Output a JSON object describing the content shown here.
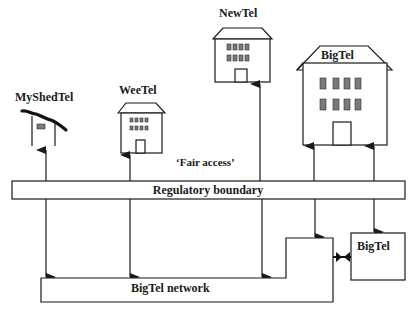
{
  "diagram": {
    "entities": [
      {
        "id": "myshedtel",
        "label": "MyShedTel",
        "type": "shed"
      },
      {
        "id": "weetel",
        "label": "WeeTel",
        "type": "small-building"
      },
      {
        "id": "newtel",
        "label": "NewTel",
        "type": "medium-building"
      },
      {
        "id": "bigtel_building",
        "label": "BigTel",
        "type": "large-building"
      },
      {
        "id": "bigtel_box",
        "label": "BigTel",
        "type": "box"
      }
    ],
    "annotation": "‘Fair access’",
    "regulatory_boundary": {
      "label": "Regulatory boundary"
    },
    "network": {
      "label": "BigTel network"
    },
    "connections": [
      {
        "from": "myshedtel",
        "to": "bigtel_network",
        "via": "regulatory_boundary",
        "direction": "bidirectional"
      },
      {
        "from": "weetel",
        "to": "bigtel_network",
        "via": "regulatory_boundary",
        "direction": "bidirectional"
      },
      {
        "from": "newtel",
        "to": "bigtel_network",
        "via": "regulatory_boundary",
        "direction": "bidirectional"
      },
      {
        "from": "bigtel_building",
        "to": "bigtel_network",
        "via": "regulatory_boundary",
        "direction": "bidirectional"
      },
      {
        "from": "bigtel_building",
        "to": "bigtel_box",
        "via": "regulatory_boundary",
        "direction": "bidirectional"
      },
      {
        "from": "bigtel_box",
        "to": "bigtel_network",
        "direction": "bidirectional-connector"
      }
    ]
  }
}
